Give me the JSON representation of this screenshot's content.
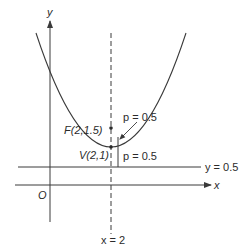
{
  "diagram": {
    "type": "parabola-focus-directrix",
    "colors": {
      "stroke": "#3a3a3a",
      "text": "#2b2b2b",
      "background": "#ffffff"
    },
    "axes": {
      "x_label": "x",
      "y_label": "y",
      "origin_label": "O"
    },
    "labels": {
      "focus": "F(2,1.5)",
      "vertex": "V(2,1)",
      "p_focus": "p = 0.5",
      "p_directrix": "p = 0.5",
      "directrix": "y = 0.5",
      "axis_of_symmetry": "x = 2"
    },
    "points": {
      "focus": {
        "x": 2,
        "y": 1.5
      },
      "vertex": {
        "x": 2,
        "y": 1
      }
    },
    "lines": {
      "directrix_y": 0.5,
      "axis_of_symmetry_x": 2
    },
    "p_value": 0.5
  }
}
